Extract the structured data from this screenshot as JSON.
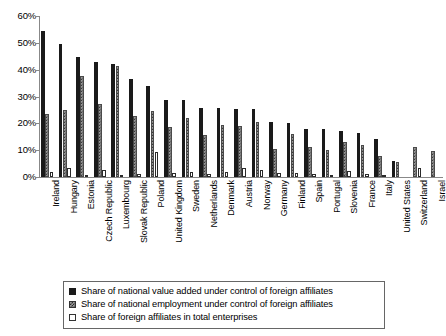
{
  "chart_data": {
    "type": "bar",
    "title": "",
    "xlabel": "",
    "ylabel": "",
    "ylim": [
      0,
      60
    ],
    "ytick_labels": [
      "60%",
      "50%",
      "40%",
      "30%",
      "20%",
      "10%",
      "0%"
    ],
    "ytick_values": [
      60,
      50,
      40,
      30,
      20,
      10,
      0
    ],
    "grid": false,
    "legend_position": "bottom",
    "categories": [
      "Ireland",
      "Hungary",
      "Estonia",
      "Czech Republic",
      "Luxembourg",
      "Slovak Republic",
      "Poland",
      "United Kingdom",
      "Sweden",
      "Netherlands",
      "Denmark",
      "Austria",
      "Norway",
      "Germany",
      "Finland",
      "Spain",
      "Portugal",
      "Slovenia",
      "France",
      "Italy",
      "United States",
      "Switzerland",
      "Israel"
    ],
    "series": [
      {
        "name": "Share of national value added under control of foreign affiliates",
        "pattern": "solid-black",
        "values": [
          54.5,
          49.4,
          44.9,
          43.0,
          42.3,
          36.7,
          34.0,
          28.7,
          28.6,
          25.8,
          25.6,
          25.4,
          25.2,
          20.4,
          20.0,
          17.9,
          17.8,
          17.3,
          16.3,
          14.2,
          6.0,
          null,
          null
        ]
      },
      {
        "name": "Share of national employment under control of foreign affiliates",
        "pattern": "checkered-gray",
        "values": [
          23.5,
          24.9,
          37.8,
          27.1,
          41.5,
          22.9,
          24.5,
          18.5,
          21.9,
          15.5,
          19.3,
          19.0,
          20.5,
          10.3,
          16.0,
          11.2,
          9.9,
          12.9,
          11.8,
          7.9,
          5.5,
          11.0,
          9.7
        ]
      },
      {
        "name": "Share of foreign affiliates in total enterprises",
        "pattern": "white-outline",
        "values": [
          1.9,
          3.5,
          0.4,
          2.5,
          0.3,
          1.0,
          9.2,
          1.5,
          2.0,
          1.2,
          1.8,
          3.3,
          2.6,
          1.4,
          1.5,
          1.0,
          0.6,
          2.2,
          1.0,
          0.3,
          null,
          3.4,
          null
        ]
      }
    ]
  }
}
